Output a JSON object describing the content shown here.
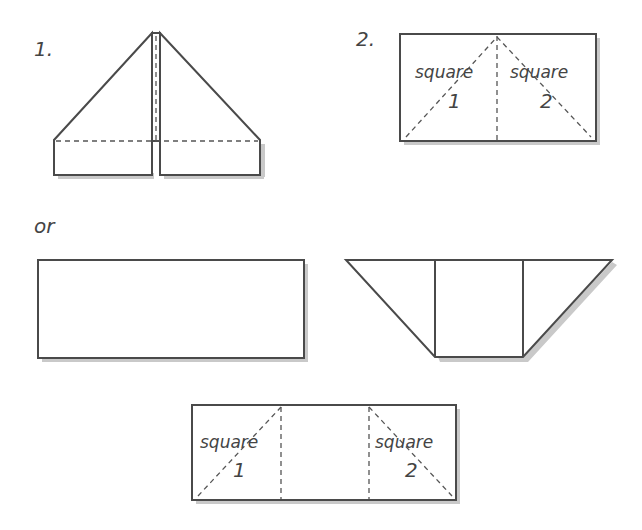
{
  "figure_1": {
    "label": "1."
  },
  "figure_2": {
    "label": "2.",
    "left_square": {
      "word": "square",
      "number": "1"
    },
    "right_square": {
      "word": "square",
      "number": "2"
    }
  },
  "separator": {
    "text": "or"
  },
  "figure_3": {
    "description": "plain rectangle"
  },
  "figure_4": {
    "description": "trapezoid with center square"
  },
  "figure_5": {
    "left_square": {
      "word": "square",
      "number": "1"
    },
    "right_square": {
      "word": "square",
      "number": "2"
    }
  },
  "colors": {
    "line": "#4a4a4a",
    "shadow": "#c9c9c9",
    "text": "#444444"
  }
}
